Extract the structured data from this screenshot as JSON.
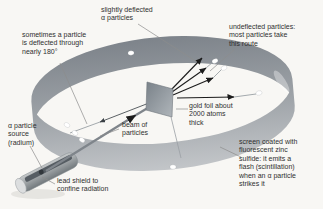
{
  "canvas": {
    "width": 323,
    "height": 209
  },
  "colors": {
    "background": "#f8f7f4",
    "text": "#2f2f30",
    "band_dark": "#7e848b",
    "band_mid": "#9da2a7",
    "band_light": "#c4c7ca",
    "foil_dark": "#7d858c",
    "foil_light": "#aeb4b9",
    "shield_light": "#cbcecf",
    "shield_dark": "#6d7478",
    "slot": "#565d63",
    "cap": "#dcdedf",
    "source": "#31373c",
    "beam": "#7f858b",
    "arrow": "#1c1c1c",
    "pointer": "#8c8c8c",
    "thin_line": "#9aa0a5",
    "flash": "#ffffff",
    "shadow": "#e6e5e1"
  },
  "labels": {
    "slightly_deflected": {
      "text": "slightly deflected\nα particles",
      "x": 101,
      "y": 6
    },
    "sometimes_180": {
      "text": "sometimes a particle\nis deflected through\nnearly 180°",
      "x": 22,
      "y": 31
    },
    "undeflected": {
      "text": "undeflected particles:\nmost particles take\nthis route",
      "x": 229,
      "y": 23
    },
    "gold_foil": {
      "text": "gold foil about\n2000 atoms\nthick",
      "x": 189,
      "y": 102
    },
    "screen": {
      "text": "screen coated with\nfluorescent zinc\nsulfide: it emits a\nflash (scintillation)\nwhen an α particle\nstrikes it",
      "x": 239,
      "y": 138
    },
    "source": {
      "text": "α particle\nsource\n(radium)",
      "x": 8,
      "y": 122
    },
    "beam": {
      "text": "beam of\nparticles",
      "x": 122,
      "y": 121
    },
    "lead_shield": {
      "text": "lead shield to\nconfine radiation",
      "x": 57,
      "y": 177
    }
  },
  "diagram": {
    "flashes": [
      [
        215,
        61,
        -25
      ],
      [
        224,
        68,
        -25
      ],
      [
        259,
        93,
        -15
      ],
      [
        131,
        53,
        -10
      ],
      [
        67,
        125,
        35
      ],
      [
        75,
        133,
        35
      ],
      [
        82,
        140,
        35
      ],
      [
        173,
        167,
        5
      ]
    ],
    "particle_arrows": [
      {
        "from": [
          171,
          90
        ],
        "to": [
          202,
          58
        ]
      },
      {
        "from": [
          172,
          92
        ],
        "to": [
          206,
          68
        ],
        "cont": [
          213,
          62
        ]
      },
      {
        "from": [
          173,
          95
        ],
        "to": [
          213,
          78
        ],
        "cont": [
          222,
          69
        ]
      },
      {
        "from": [
          177,
          98
        ],
        "to": [
          234,
          97
        ],
        "cont": [
          256,
          94
        ]
      },
      {
        "from": [
          149,
          103
        ],
        "to": [
          100,
          122
        ],
        "cont": [
          70,
          133
        ],
        "tiny": true
      }
    ],
    "beam": {
      "from": [
        46,
        171
      ],
      "mid": [
        136,
        115
      ],
      "to": [
        166,
        97
      ]
    },
    "foil": {
      "points": [
        [
          147,
          82
        ],
        [
          173,
          89
        ],
        [
          172,
          117
        ],
        [
          146,
          110
        ]
      ],
      "stand": [
        171,
        117,
        181,
        158
      ]
    },
    "pointer_lines": [
      [
        138,
        24,
        197,
        62
      ],
      [
        60,
        63,
        87,
        124
      ],
      [
        234,
        50,
        210,
        71
      ],
      [
        188,
        109,
        176,
        109
      ],
      [
        241,
        157,
        220,
        147
      ],
      [
        30,
        146,
        42,
        168
      ],
      [
        119,
        129,
        100,
        136
      ],
      [
        55,
        184,
        42,
        177
      ]
    ]
  }
}
